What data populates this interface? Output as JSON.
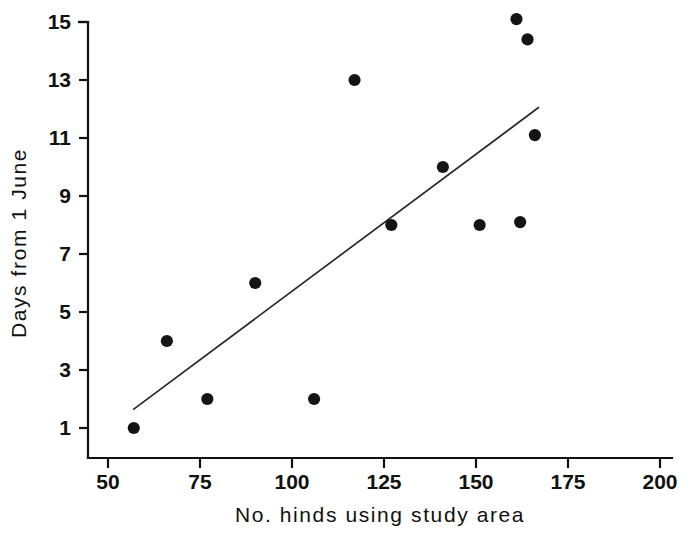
{
  "chart_data": {
    "type": "scatter",
    "title": "",
    "xlabel": "No. hinds using study area",
    "ylabel": "Days from 1 June",
    "xlim": [
      50,
      200
    ],
    "ylim": [
      1,
      15
    ],
    "grid": false,
    "legend": null,
    "xticks": [
      50,
      75,
      100,
      125,
      150,
      175,
      200
    ],
    "xtick_labels": [
      "50",
      "75",
      "100",
      "125",
      "150",
      "175",
      "200"
    ],
    "yticks": [
      1,
      3,
      5,
      7,
      9,
      11,
      13,
      15
    ],
    "ytick_labels": [
      "1",
      "3",
      "5",
      "7",
      "9",
      "11",
      "13",
      "15"
    ],
    "point_color": "#141414",
    "line_color": "#2a2a2a",
    "axis_color": "#111111",
    "points": [
      {
        "x": 57,
        "y": 1.0
      },
      {
        "x": 66,
        "y": 4.0
      },
      {
        "x": 77,
        "y": 2.0
      },
      {
        "x": 90,
        "y": 6.0
      },
      {
        "x": 106,
        "y": 2.0
      },
      {
        "x": 117,
        "y": 13.0
      },
      {
        "x": 127,
        "y": 8.0
      },
      {
        "x": 141,
        "y": 10.0
      },
      {
        "x": 151,
        "y": 8.0
      },
      {
        "x": 161,
        "y": 15.1
      },
      {
        "x": 162,
        "y": 8.1
      },
      {
        "x": 164,
        "y": 14.4
      },
      {
        "x": 166,
        "y": 11.1
      }
    ],
    "fit_line": {
      "label": "regression line",
      "x_start": 57,
      "y_start": 1.65,
      "x_end": 167,
      "y_end": 12.05
    }
  },
  "axis_titles": {
    "x": "No. hinds using study area",
    "y": "Days from 1 June"
  }
}
